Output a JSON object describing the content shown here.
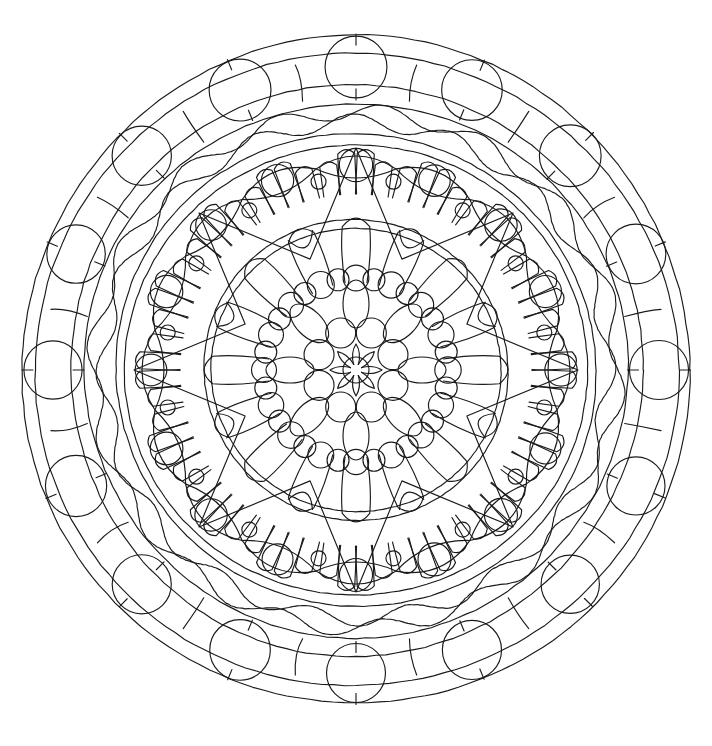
{
  "artwork": {
    "title": "Mandala Coloring Page",
    "type": "line-art-mandala",
    "description": "Black and white symmetrical circular mandala coloring page composed of concentric rings of circles, wavy bands, an eight-pointed star, petal clusters and a central rosette",
    "canvas": {
      "width": 712,
      "height": 746
    },
    "colors": {
      "background": "#ffffff",
      "stroke": "#1a1a1a"
    },
    "stroke_width": 1.15,
    "center": {
      "x": 356,
      "y": 370
    },
    "symmetry_order": 16,
    "rings": [
      {
        "name": "outer-boundary-ring",
        "kind": "circle-band",
        "radii": [
          334,
          322,
          286,
          272
        ],
        "note": "four nested thin outline circles forming the outermost band"
      },
      {
        "name": "outer-large-circle-ring",
        "kind": "circle-ring",
        "radius": 303,
        "count": 16,
        "bead_radius": 30,
        "note": "sixteen large circles with short radial tick marks"
      },
      {
        "name": "outer-wavy-band",
        "kind": "wave-band",
        "radii": [
          262,
          252
        ],
        "waves": 16,
        "amplitude": 8,
        "note": "double wavy line band running between the outer and middle rings"
      },
      {
        "name": "middle-boundary-ring",
        "kind": "circle-band",
        "radii": [
          240,
          230
        ],
        "note": "two nested circles enclosing the star layer"
      },
      {
        "name": "eye-lens-ring",
        "kind": "lens-ring",
        "radius": 205,
        "count": 16,
        "lens_half_width": 22,
        "bead_radius": 16,
        "note": "pointed eye / lens shapes each containing a small circle"
      },
      {
        "name": "eight-point-star",
        "kind": "star",
        "points": 8,
        "outer_radius": 222,
        "inner_radius": 120,
        "note": "large eight pointed star drawn with straight lines over the petal ring"
      },
      {
        "name": "finger-petal-ring",
        "kind": "petal-cluster-ring",
        "radius": 176,
        "count": 16,
        "fingers_per_cluster": 4,
        "note": "outward pointing rounded finger clusters around the inner disc"
      },
      {
        "name": "inner-disc-boundary",
        "kind": "circle-band",
        "radii": [
          152,
          144
        ],
        "note": "two circles bounding the inner floral disc"
      },
      {
        "name": "inner-big-petal-ring",
        "kind": "petal-ring",
        "radius": 116,
        "count": 16,
        "petal_width": 22,
        "petal_length": 56,
        "note": "large rounded tear drop petals radiating from the core"
      },
      {
        "name": "inner-bead-ring",
        "kind": "circle-ring",
        "radius": 92,
        "count": 16,
        "bead_radius": 13,
        "note": "ring of small circles between the petals"
      },
      {
        "name": "mid-oval-ring",
        "kind": "ellipse-ring",
        "radius": 66,
        "count": 8,
        "ellipse_rx": 13,
        "ellipse_ry": 24,
        "note": "ring of radially oriented ovals"
      },
      {
        "name": "core-bead-ring",
        "kind": "circle-ring",
        "radius": 40,
        "count": 8,
        "bead_radius": 15,
        "note": "eight circles packed around the hub"
      },
      {
        "name": "core-petal-ring",
        "kind": "petal-ring",
        "radius": 22,
        "count": 8,
        "petal_width": 9,
        "petal_length": 20,
        "note": "eight tiny pointed petals forming the central rosette"
      },
      {
        "name": "core-hub",
        "kind": "circle",
        "radius": 13,
        "note": "the single small circle at the exact center"
      }
    ]
  }
}
